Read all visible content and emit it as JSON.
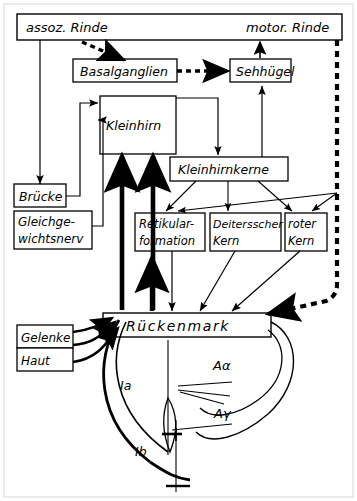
{
  "diagram": {
    "language": "de",
    "line_color": "#000000",
    "background": "#ffffff"
  },
  "boxes": {
    "cortex": {
      "label_left": "assoz. Rinde",
      "label_right": "motor. Rinde"
    },
    "basalganglien": {
      "label": "Basalganglien"
    },
    "sehhuegel": {
      "label": "Sehhügel"
    },
    "kleinhirn": {
      "label": "Kleinhirn"
    },
    "kleinhirnkerne": {
      "label": "Kleinhirnkerne"
    },
    "bruecke": {
      "label": "Brücke"
    },
    "gleichgewichtsnerv": {
      "line1": "Gleichge-",
      "line2": "wichtsnerv"
    },
    "retikularformation": {
      "line1": "Retikular-",
      "line2": "formation"
    },
    "deitersscher_kern": {
      "line1": "Deitersscher",
      "line2": "Kern"
    },
    "roter_kern": {
      "line1": "roter",
      "line2": "Kern"
    },
    "rueckenmark": {
      "label": "Rückenmark"
    },
    "gelenke": {
      "label": "Gelenke"
    },
    "haut": {
      "label": "Haut"
    }
  },
  "fiber_labels": {
    "ia": "Ia",
    "ib": "Ib",
    "a_alpha": "Aα",
    "a_gamma": "Aγ"
  }
}
